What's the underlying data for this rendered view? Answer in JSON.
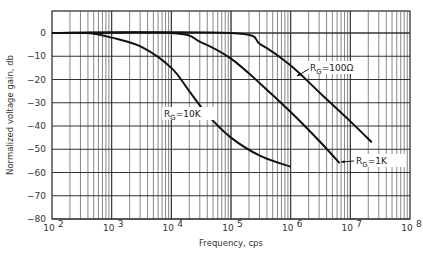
{
  "chart_data": {
    "type": "line",
    "title": "",
    "xlabel": "Frequency, cps",
    "ylabel": "Normalized voltage gain, db",
    "xscale": "log",
    "xlim": [
      100,
      100000000
    ],
    "ylim": [
      -80,
      8
    ],
    "x_tick_labels": [
      "10^2",
      "10^3",
      "10^4",
      "10^5",
      "10^6",
      "10^7",
      "10^8"
    ],
    "x_tick_exponents": [
      2,
      3,
      4,
      5,
      6,
      7,
      8
    ],
    "y_ticks": [
      0,
      -10,
      -20,
      -30,
      -40,
      -50,
      -60,
      -70,
      -80
    ],
    "y_tick_labels": [
      "0",
      "-10",
      "-20",
      "-30",
      "-40",
      "-50",
      "-60",
      "-70",
      "-80"
    ],
    "grid": true,
    "series": [
      {
        "name": "RG = 10K",
        "label_sub": "G",
        "label_prefix": "R",
        "label_suffix": "=10K",
        "points_log10f_db": [
          [
            2,
            0
          ],
          [
            2.6,
            0
          ],
          [
            3.0,
            -2
          ],
          [
            3.5,
            -6
          ],
          [
            4.0,
            -15
          ],
          [
            4.3,
            -25
          ],
          [
            4.6,
            -35
          ],
          [
            5.0,
            -45
          ],
          [
            5.5,
            -53
          ],
          [
            6.0,
            -57.5
          ]
        ]
      },
      {
        "name": "RG = 1K",
        "label_sub": "G",
        "label_prefix": "R",
        "label_suffix": "=1K",
        "points_log10f_db": [
          [
            2,
            0
          ],
          [
            4.0,
            0
          ],
          [
            4.5,
            -4
          ],
          [
            5.0,
            -11
          ],
          [
            5.5,
            -22
          ],
          [
            6.0,
            -34
          ],
          [
            6.5,
            -47
          ],
          [
            6.82,
            -56
          ]
        ]
      },
      {
        "name": "RG = 100Ω",
        "label_sub": "G",
        "label_prefix": "R",
        "label_suffix": "=100Ω",
        "points_log10f_db": [
          [
            2,
            0
          ],
          [
            5.0,
            0
          ],
          [
            5.5,
            -5
          ],
          [
            6.0,
            -14
          ],
          [
            6.5,
            -26
          ],
          [
            7.0,
            -38
          ],
          [
            7.36,
            -47
          ]
        ]
      }
    ],
    "legend_position": "inline annotations"
  }
}
